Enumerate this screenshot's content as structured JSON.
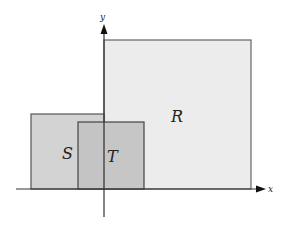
{
  "diagram": {
    "axes": {
      "x_label": "x",
      "y_label": "y",
      "color": "#333333"
    },
    "regions": [
      {
        "id": "R",
        "label": "R",
        "fill": "#ececec",
        "stroke": "#666666"
      },
      {
        "id": "S",
        "label": "S",
        "fill": "#d3d3d3",
        "stroke": "#555555"
      },
      {
        "id": "T",
        "label": "T",
        "fill": "#c2c2c2",
        "stroke": "#444444"
      }
    ]
  }
}
